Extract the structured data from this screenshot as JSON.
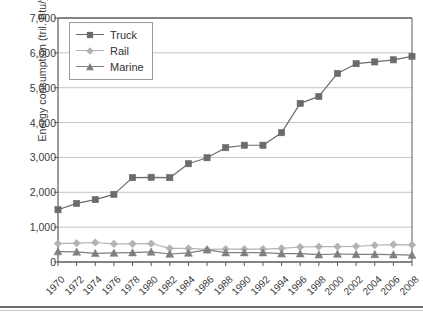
{
  "chart_data": {
    "type": "line",
    "title": "",
    "xlabel": "",
    "ylabel": "Energy consumption (tril. Btu/year)",
    "x": [
      1970,
      1972,
      1974,
      1976,
      1978,
      1980,
      1982,
      1984,
      1986,
      1988,
      1990,
      1992,
      1994,
      1996,
      1998,
      2000,
      2002,
      2004,
      2006,
      2008
    ],
    "xtick_labels": [
      "1970",
      "1972",
      "1974",
      "1976",
      "1978",
      "1980",
      "1982",
      "1984",
      "1986",
      "1988",
      "1990",
      "1992",
      "1994",
      "1996",
      "1998",
      "2000",
      "2002",
      "2004",
      "2006",
      "2008"
    ],
    "ylim": [
      0,
      7000
    ],
    "ytick_labels": [
      "0",
      "1,000",
      "2,000",
      "3,000",
      "4,000",
      "5,000",
      "6,000",
      "7,000"
    ],
    "ytick_values": [
      0,
      1000,
      2000,
      3000,
      4000,
      5000,
      6000,
      7000
    ],
    "grid": true,
    "legend_position": "upper-left",
    "series": [
      {
        "name": "Truck",
        "marker": "square",
        "color": "#6b6b6b",
        "values": [
          1500,
          1680,
          1790,
          1940,
          2420,
          2430,
          2420,
          2820,
          2990,
          3280,
          3350,
          3350,
          3710,
          4550,
          4750,
          5410,
          5690,
          5740,
          5800,
          5900
        ]
      },
      {
        "name": "Rail",
        "marker": "diamond",
        "color": "#b3b3b3",
        "values": [
          530,
          540,
          560,
          520,
          520,
          530,
          390,
          390,
          360,
          370,
          370,
          370,
          390,
          430,
          440,
          440,
          450,
          480,
          500,
          490
        ]
      },
      {
        "name": "Marine",
        "marker": "triangle",
        "color": "#7f7f7f",
        "values": [
          300,
          290,
          250,
          260,
          270,
          290,
          230,
          260,
          350,
          270,
          270,
          270,
          240,
          240,
          210,
          230,
          220,
          220,
          210,
          200
        ]
      }
    ]
  },
  "legend": {
    "items": [
      {
        "label": "Truck"
      },
      {
        "label": "Rail"
      },
      {
        "label": "Marine"
      }
    ]
  },
  "colors": {
    "truck": "#6b6b6b",
    "rail": "#b3b3b3",
    "marine": "#7f7f7f",
    "axis": "#5a5a5a",
    "grid": "#bdbdbd",
    "text": "#3b3b3b"
  }
}
